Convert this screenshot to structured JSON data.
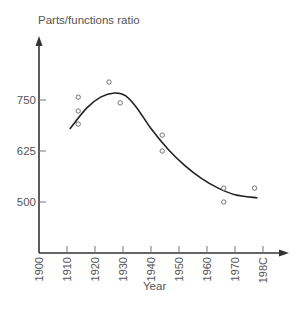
{
  "chart_data": {
    "type": "scatter",
    "title": "",
    "ylabel": "Parts/functions ratio",
    "xlabel": "Year",
    "xlim": [
      1900,
      1980
    ],
    "ylim": [
      375,
      890
    ],
    "x_ticks": [
      1900,
      1910,
      1920,
      1930,
      1940,
      1950,
      1960,
      1970,
      1980
    ],
    "x_tick_labels": [
      "1900",
      "1910",
      "1920",
      "1930",
      "1940",
      "1950",
      "1960",
      "1970",
      "198C"
    ],
    "y_ticks": [
      500,
      625,
      750
    ],
    "y_tick_labels": [
      "500",
      "625",
      "750"
    ],
    "grid": false,
    "legend": null,
    "series": [
      {
        "name": "observations",
        "type": "scatter",
        "marker": "open-circle",
        "points": [
          {
            "x": 1914,
            "y": 757
          },
          {
            "x": 1914,
            "y": 723
          },
          {
            "x": 1914,
            "y": 691
          },
          {
            "x": 1925,
            "y": 794
          },
          {
            "x": 1929,
            "y": 743
          },
          {
            "x": 1944,
            "y": 664
          },
          {
            "x": 1944,
            "y": 625
          },
          {
            "x": 1966,
            "y": 534
          },
          {
            "x": 1966,
            "y": 500
          },
          {
            "x": 1977,
            "y": 534
          }
        ]
      },
      {
        "name": "fitted trend",
        "type": "line",
        "smooth": true,
        "points": [
          {
            "x": 1911,
            "y": 679
          },
          {
            "x": 1917,
            "y": 730
          },
          {
            "x": 1922,
            "y": 757
          },
          {
            "x": 1927,
            "y": 767
          },
          {
            "x": 1931,
            "y": 760
          },
          {
            "x": 1935,
            "y": 730
          },
          {
            "x": 1940,
            "y": 680
          },
          {
            "x": 1946,
            "y": 630
          },
          {
            "x": 1952,
            "y": 590
          },
          {
            "x": 1958,
            "y": 558
          },
          {
            "x": 1964,
            "y": 534
          },
          {
            "x": 1970,
            "y": 518
          },
          {
            "x": 1978,
            "y": 510
          }
        ]
      }
    ]
  },
  "colors": {
    "axis": "#333333",
    "curve": "#222222",
    "marker": "#666666",
    "text": "#555555"
  }
}
